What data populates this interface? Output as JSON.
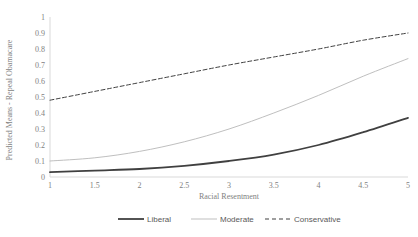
{
  "chart_data": {
    "type": "line",
    "title": "",
    "xlabel": "Racial Resentment",
    "ylabel": "Predicted Means - Repeal Obamacare",
    "xlim": [
      1,
      5
    ],
    "ylim": [
      0,
      1
    ],
    "xticks": [
      "1",
      "1.5",
      "2",
      "2.5",
      "3",
      "3.5",
      "4",
      "4.5",
      "5"
    ],
    "yticks": [
      "0",
      "0.1",
      "0.2",
      "0.3",
      "0.4",
      "0.5",
      "0.6",
      "0.7",
      "0.8",
      "0.9",
      "1"
    ],
    "grid": false,
    "legend_position": "bottom",
    "x": [
      1,
      1.5,
      2,
      2.5,
      3,
      3.5,
      4,
      4.5,
      5
    ],
    "series": [
      {
        "name": "Liberal",
        "style": "solid",
        "color": "#404040",
        "width": 1.8,
        "values": [
          0.03,
          0.04,
          0.05,
          0.07,
          0.1,
          0.14,
          0.2,
          0.28,
          0.37
        ]
      },
      {
        "name": "Moderate",
        "style": "solid",
        "color": "#bfbfbf",
        "width": 1.0,
        "values": [
          0.1,
          0.12,
          0.16,
          0.22,
          0.3,
          0.4,
          0.51,
          0.63,
          0.74
        ]
      },
      {
        "name": "Conservative",
        "style": "dashed",
        "color": "#404040",
        "width": 1.0,
        "values": [
          0.48,
          0.535,
          0.59,
          0.645,
          0.7,
          0.75,
          0.8,
          0.855,
          0.9
        ]
      }
    ]
  },
  "legend": {
    "items": [
      {
        "label": "Liberal"
      },
      {
        "label": "Moderate"
      },
      {
        "label": "Conservative"
      }
    ]
  },
  "axes": {
    "y_axis_title": "Predicted Means - Repeal Obamacare",
    "x_axis_title": "Racial Resentment"
  }
}
